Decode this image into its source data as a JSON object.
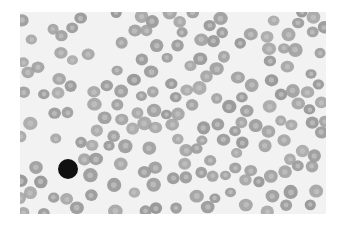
{
  "image": {
    "description": "Grayscale blood smear micrograph showing numerous red blood cells and a single dark-stained lymphocyte in the lower left",
    "background": "#f2f2f2",
    "rbc_fill": "#9a9a9a",
    "rbc_center": "#c4c4c4",
    "lymphocyte_fill": "#111111",
    "lymphocyte": {
      "x": 48,
      "y": 157,
      "r": 10
    }
  }
}
